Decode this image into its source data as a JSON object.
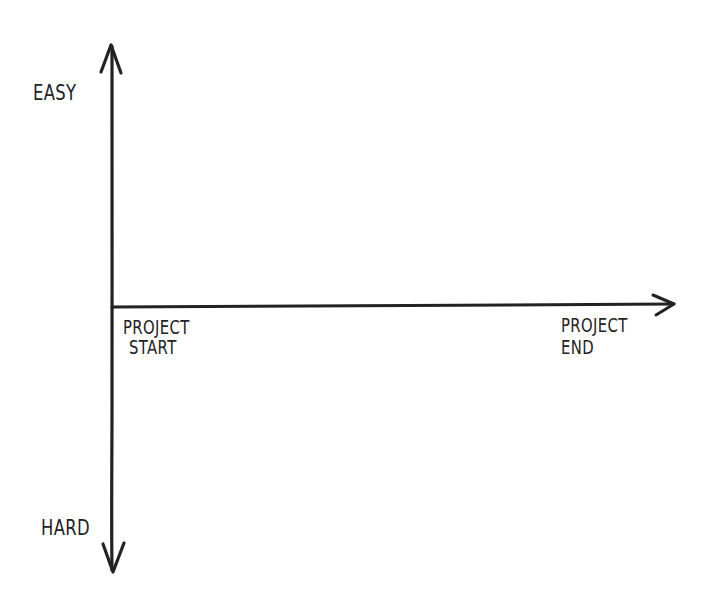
{
  "diagram": {
    "type": "hand-drawn-axes",
    "stroke_color": "#222222",
    "background": "#ffffff",
    "y_axis": {
      "top_label": "EASY",
      "bottom_label": "HARD",
      "direction": "bidirectional"
    },
    "x_axis": {
      "start_label_line1": "PROJECT",
      "start_label_line2": "START",
      "end_label_line1": "PROJECT",
      "end_label_line2": "END",
      "direction": "right"
    }
  }
}
